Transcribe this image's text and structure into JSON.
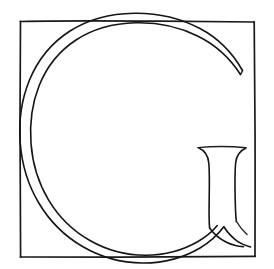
{
  "artwork": {
    "title": "Letter G",
    "subject": "capital-letter-g",
    "style": "hand-drawn outline line art",
    "medium": "pen and ink line drawing",
    "glyph": "G",
    "script": "Latin",
    "lettercase": "uppercase",
    "alt_text": "Outline drawing of a serif capital letter G inside a hand-drawn square border",
    "background_color": "#ffffff",
    "ink_color": "#151515",
    "canvas": {
      "width": 274,
      "height": 269
    }
  },
  "frame": {
    "name": "square border",
    "shape": "square",
    "stroke_color": "#1a1a1a",
    "left": 20,
    "top": 21,
    "right": 255,
    "bottom": 257
  },
  "letterform": {
    "name": "capital G",
    "parts": [
      {
        "id": "bowl-outer",
        "label": "outer bowl curve"
      },
      {
        "id": "bowl-inner",
        "label": "inner bowl curve"
      },
      {
        "id": "upper-terminal",
        "label": "upper terminal bevel"
      },
      {
        "id": "stem",
        "label": "vertical stem with serif"
      },
      {
        "id": "stem-serif-top",
        "label": "top serif of stem"
      },
      {
        "id": "lower-terminal",
        "label": "lower terminal joining stem"
      }
    ],
    "extends_past_frame": [
      "top",
      "left",
      "bottom"
    ],
    "stroke_weight": "thin contour line"
  }
}
